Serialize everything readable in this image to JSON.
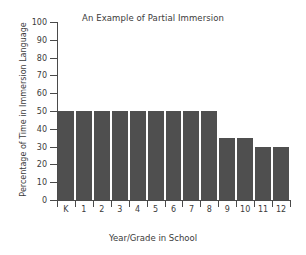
{
  "chart_data": {
    "type": "bar",
    "title": "An Example of Partial Immersion",
    "xlabel": "Year/Grade in School",
    "ylabel": "Percentage of Time in Immersion Language",
    "categories": [
      "K",
      "1",
      "2",
      "3",
      "4",
      "5",
      "6",
      "7",
      "8",
      "9",
      "10",
      "11",
      "12"
    ],
    "values": [
      50,
      50,
      50,
      50,
      50,
      50,
      50,
      50,
      50,
      35,
      35,
      30,
      30
    ],
    "ylim": [
      0,
      100
    ],
    "ytick_labels": [
      "0",
      "10",
      "20",
      "30",
      "40",
      "50",
      "60",
      "70",
      "80",
      "90",
      "100"
    ],
    "ytick_values": [
      0,
      10,
      20,
      30,
      40,
      50,
      60,
      70,
      80,
      90,
      100
    ],
    "grid": false,
    "legend": false,
    "bar_color": "#4f4f4f",
    "axis_color": "#4a4a4a",
    "background": "#ffffff"
  }
}
